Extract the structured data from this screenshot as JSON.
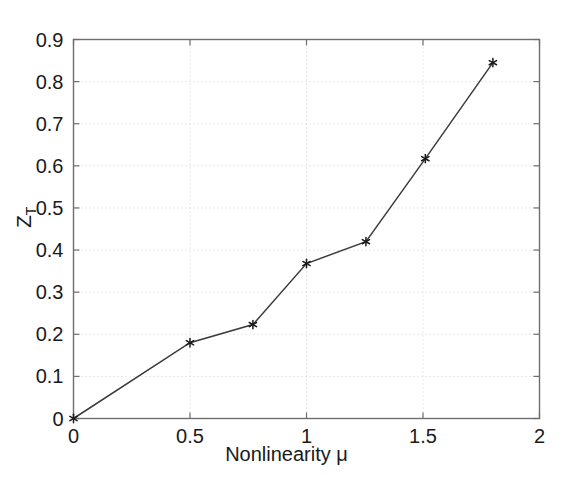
{
  "chart_data": {
    "type": "line",
    "title": "",
    "xlabel": "Nonlinearity μ",
    "ylabel": "Z_T",
    "ylabel_base": "Z",
    "ylabel_sub": "T",
    "xlim": [
      0,
      2
    ],
    "ylim": [
      0,
      0.9
    ],
    "grid": true,
    "grid_style": "dotted",
    "legend": null,
    "xticks": [
      0,
      0.5,
      1,
      1.5,
      2
    ],
    "xtick_labels": [
      "0",
      "0.5",
      "1",
      "1.5",
      "2"
    ],
    "yticks": [
      0,
      0.1,
      0.2,
      0.3,
      0.4,
      0.5,
      0.6,
      0.7,
      0.8,
      0.9
    ],
    "ytick_labels": [
      "0",
      "0.1",
      "0.2",
      "0.3",
      "0.4",
      "0.5",
      "0.6",
      "0.7",
      "0.8",
      "0.9"
    ],
    "series": [
      {
        "name": "ZT vs nonlinearity",
        "marker": "star",
        "line_color": "#3c3c3c",
        "marker_color": "#1a1a1a",
        "x": [
          0,
          0.5,
          0.77,
          1.0,
          1.255,
          1.51,
          1.8
        ],
        "values": [
          0,
          0.18,
          0.223,
          0.368,
          0.42,
          0.617,
          0.845
        ]
      }
    ]
  },
  "style": {
    "axis_color": "#6e6e6e",
    "grid_color": "#d0d0d0",
    "text_color": "#1a1a1a",
    "background": "#ffffff"
  }
}
